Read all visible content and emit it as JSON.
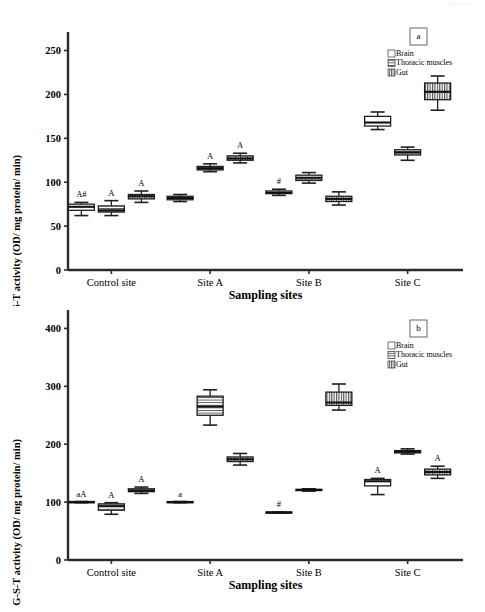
{
  "figure": {
    "top_artifact_text": "Results",
    "legend_entries": [
      {
        "key": "brain",
        "label": "Brain",
        "pattern": "empty"
      },
      {
        "key": "thoracic",
        "label": "Thoracic muscles",
        "pattern": "horizontal-lines"
      },
      {
        "key": "gut",
        "label": "Gut",
        "pattern": "vertical-lines"
      }
    ],
    "xlabel": "Sampling sites",
    "ylabel": "G-S-T activity (OD/ mg protein/ min)",
    "categories": [
      "Control site",
      "Site A",
      "Site B",
      "Site C"
    ]
  },
  "chart_data": [
    {
      "type": "box",
      "panel_label": "a",
      "title": "",
      "xlabel": "Sampling sites",
      "ylabel": "G-S-T activity (OD/ mg protein/ min)",
      "categories": [
        "Control site",
        "Site A",
        "Site B",
        "Site C"
      ],
      "yticks": [
        0,
        50,
        100,
        150,
        200,
        250
      ],
      "ylim": [
        0,
        262
      ],
      "grid": false,
      "legend_position": "top-right",
      "series": [
        {
          "name": "Brain",
          "pattern": "empty",
          "boxes": [
            {
              "category": "Control site",
              "whisker_low": 62,
              "q1": 68,
              "median": 72,
              "q3": 75,
              "whisker_high": 77,
              "annotation": "A#"
            },
            {
              "category": "Site A",
              "whisker_low": 78,
              "q1": 80,
              "median": 82,
              "q3": 84,
              "whisker_high": 86,
              "annotation": ""
            },
            {
              "category": "Site B",
              "whisker_low": 85,
              "q1": 87,
              "median": 88,
              "q3": 90,
              "whisker_high": 92,
              "annotation": "#"
            },
            {
              "category": "Site C",
              "whisker_low": 160,
              "q1": 164,
              "median": 168,
              "q3": 175,
              "whisker_high": 180,
              "annotation": ""
            }
          ]
        },
        {
          "name": "Thoracic muscles",
          "pattern": "horizontal-lines",
          "boxes": [
            {
              "category": "Control site",
              "whisker_low": 62,
              "q1": 66,
              "median": 68,
              "q3": 73,
              "whisker_high": 79,
              "annotation": "A"
            },
            {
              "category": "Site A",
              "whisker_low": 112,
              "q1": 114,
              "median": 116,
              "q3": 118,
              "whisker_high": 121,
              "annotation": "A"
            },
            {
              "category": "Site B",
              "whisker_low": 99,
              "q1": 102,
              "median": 105,
              "q3": 108,
              "whisker_high": 111,
              "annotation": ""
            },
            {
              "category": "Site C",
              "whisker_low": 125,
              "q1": 131,
              "median": 134,
              "q3": 137,
              "whisker_high": 140,
              "annotation": ""
            }
          ]
        },
        {
          "name": "Gut",
          "pattern": "vertical-lines",
          "boxes": [
            {
              "category": "Control site",
              "whisker_low": 77,
              "q1": 81,
              "median": 84,
              "q3": 86,
              "whisker_high": 90,
              "annotation": "A"
            },
            {
              "category": "Site A",
              "whisker_low": 122,
              "q1": 125,
              "median": 127,
              "q3": 130,
              "whisker_high": 133,
              "annotation": "A"
            },
            {
              "category": "Site B",
              "whisker_low": 74,
              "q1": 78,
              "median": 81,
              "q3": 84,
              "whisker_high": 89,
              "annotation": ""
            },
            {
              "category": "Site C",
              "whisker_low": 182,
              "q1": 194,
              "median": 203,
              "q3": 213,
              "whisker_high": 221,
              "annotation": ""
            }
          ]
        }
      ]
    },
    {
      "type": "box",
      "panel_label": "b",
      "title": "",
      "xlabel": "Sampling sites",
      "ylabel": "G-S-T activity (OD/ mg protein/ min)",
      "categories": [
        "Control site",
        "Site A",
        "Site B",
        "Site C"
      ],
      "yticks": [
        0,
        100,
        200,
        300,
        400
      ],
      "ylim": [
        0,
        418
      ],
      "grid": false,
      "legend_position": "top-right",
      "series": [
        {
          "name": "Brain",
          "pattern": "empty",
          "boxes": [
            {
              "category": "Control site",
              "whisker_low": 99,
              "q1": 99,
              "median": 100,
              "q3": 101,
              "whisker_high": 101,
              "annotation": "aA"
            },
            {
              "category": "Site A",
              "whisker_low": 99,
              "q1": 99,
              "median": 100,
              "q3": 101,
              "whisker_high": 101,
              "annotation": "a"
            },
            {
              "category": "Site B",
              "whisker_low": 81,
              "q1": 81,
              "median": 82,
              "q3": 83,
              "whisker_high": 83,
              "annotation": "#"
            },
            {
              "category": "Site C",
              "whisker_low": 113,
              "q1": 128,
              "median": 136,
              "q3": 139,
              "whisker_high": 141,
              "annotation": "A"
            }
          ]
        },
        {
          "name": "Thoracic muscles",
          "pattern": "horizontal-lines",
          "boxes": [
            {
              "category": "Control site",
              "whisker_low": 79,
              "q1": 86,
              "median": 93,
              "q3": 97,
              "whisker_high": 99,
              "annotation": "A"
            },
            {
              "category": "Site A",
              "whisker_low": 233,
              "q1": 250,
              "median": 265,
              "q3": 283,
              "whisker_high": 294,
              "annotation": ""
            },
            {
              "category": "Site B",
              "whisker_low": 119,
              "q1": 120,
              "median": 121,
              "q3": 122,
              "whisker_high": 123,
              "annotation": ""
            },
            {
              "category": "Site C",
              "whisker_low": 183,
              "q1": 185,
              "median": 187,
              "q3": 189,
              "whisker_high": 192,
              "annotation": ""
            }
          ]
        },
        {
          "name": "Gut",
          "pattern": "vertical-lines",
          "boxes": [
            {
              "category": "Control site",
              "whisker_low": 115,
              "q1": 118,
              "median": 120,
              "q3": 123,
              "whisker_high": 126,
              "annotation": "A"
            },
            {
              "category": "Site A",
              "whisker_low": 164,
              "q1": 170,
              "median": 174,
              "q3": 178,
              "whisker_high": 184,
              "annotation": ""
            },
            {
              "category": "Site B",
              "whisker_low": 259,
              "q1": 267,
              "median": 272,
              "q3": 290,
              "whisker_high": 304,
              "annotation": ""
            },
            {
              "category": "Site C",
              "whisker_low": 141,
              "q1": 147,
              "median": 152,
              "q3": 157,
              "whisker_high": 162,
              "annotation": "A"
            }
          ]
        }
      ]
    }
  ]
}
